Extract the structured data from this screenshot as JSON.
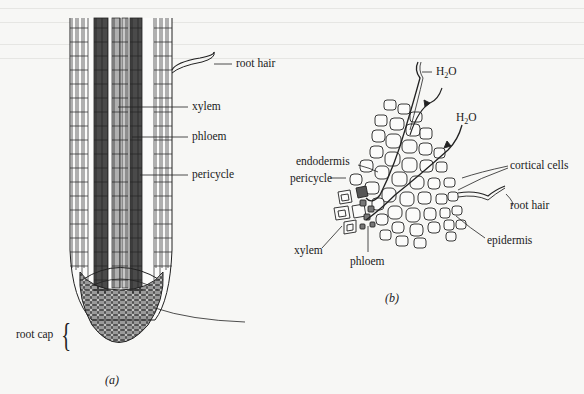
{
  "figure_a": {
    "caption": "(a)",
    "labels": {
      "root_hair": "root hair",
      "xylem": "xylem",
      "phloem": "phloem",
      "pericycle": "pericycle",
      "root_cap": "root cap"
    }
  },
  "figure_b": {
    "caption": "(b)",
    "labels": {
      "h2o_1": "H",
      "h2o_2": "H",
      "h2o_sub": "2",
      "h2o_o": "O",
      "endodermis": "endodermis",
      "pericycle": "pericycle",
      "cortical_cells": "cortical cells",
      "root_hair": "root hair",
      "epidermis": "epidermis",
      "xylem": "xylem",
      "phloem": "phloem"
    }
  },
  "colors": {
    "background": "#f7f7f5",
    "xylem_fill": "#4a4a4a",
    "phloem_fill": "#a8a8a8",
    "cap_fill": "#9a9a9a",
    "ink": "#1a1a1a"
  }
}
